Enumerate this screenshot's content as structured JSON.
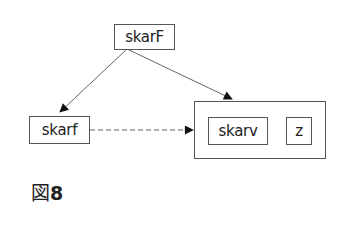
{
  "diagram": {
    "nodes": {
      "top": {
        "label": "skarF"
      },
      "left": {
        "label": "skarf"
      },
      "inner_left": {
        "label": "skarv"
      },
      "inner_right": {
        "label": "z"
      }
    },
    "edges": [
      {
        "from": "skarF",
        "to": "skarf",
        "style": "solid",
        "arrow": "filled"
      },
      {
        "from": "skarF",
        "to": "container",
        "style": "solid",
        "arrow": "filled"
      },
      {
        "from": "skarf",
        "to": "container",
        "style": "dashed",
        "arrow": "filled"
      }
    ],
    "colors": {
      "stroke": "#555555",
      "arrow": "#111111",
      "text": "#222222"
    }
  },
  "caption": {
    "prefix": "図",
    "number": "8"
  }
}
